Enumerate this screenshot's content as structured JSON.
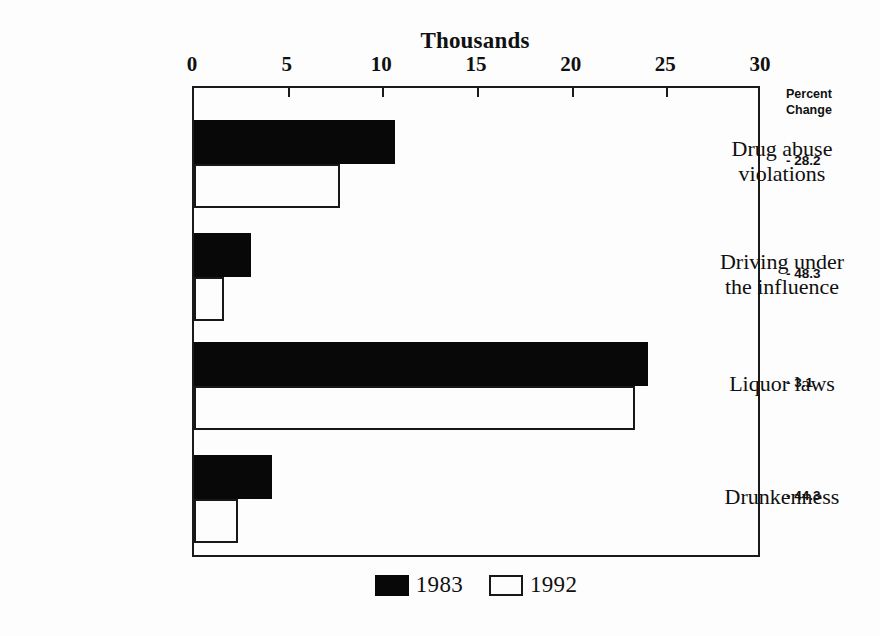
{
  "chart_data": {
    "type": "bar",
    "orientation": "horizontal",
    "title": "",
    "xlabel": "Thousands",
    "ylabel": "",
    "xlim": [
      0,
      30
    ],
    "xticks": [
      0,
      5,
      10,
      15,
      20,
      25,
      30
    ],
    "xtick_labels": [
      "0",
      "5",
      "10",
      "15",
      "20",
      "25",
      "30"
    ],
    "grid": false,
    "legend_position": "bottom-center",
    "categories": [
      "Drug abuse violations",
      "Driving under the influence",
      "Liquor laws",
      "Drunkenness"
    ],
    "category_label_lines": [
      [
        "Drug abuse",
        "violations"
      ],
      [
        "Driving under",
        "the influence"
      ],
      [
        "Liquor laws"
      ],
      [
        "Drunkenness"
      ]
    ],
    "series": [
      {
        "name": "1983",
        "color": "#080808",
        "values": [
          10.6,
          3.0,
          24.0,
          4.1
        ]
      },
      {
        "name": "1992",
        "color": "#ffffff",
        "values": [
          7.7,
          1.6,
          23.3,
          2.3
        ]
      }
    ],
    "annotations": {
      "header_lines": [
        "Percent",
        "Change"
      ],
      "values": [
        "- 28.2",
        "- 48.3",
        "- 3.1",
        "- 44.3"
      ]
    }
  },
  "legend": {
    "entries": [
      {
        "label": "1983"
      },
      {
        "label": "1992"
      }
    ]
  }
}
